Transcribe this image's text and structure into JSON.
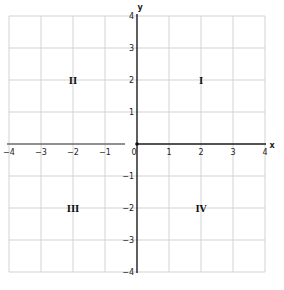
{
  "diagram": {
    "type": "coordinate-plane",
    "x_axis": {
      "label": "x",
      "min": -4,
      "max": 4,
      "step": 1
    },
    "y_axis": {
      "label": "y",
      "min": -4,
      "max": 4,
      "step": 1
    },
    "x_ticks": [
      {
        "value": -4,
        "label": "−4"
      },
      {
        "value": -3,
        "label": "−3"
      },
      {
        "value": -2,
        "label": "−2"
      },
      {
        "value": -1,
        "label": "−1"
      },
      {
        "value": 0,
        "label": "0"
      },
      {
        "value": 1,
        "label": "1"
      },
      {
        "value": 2,
        "label": "2"
      },
      {
        "value": 3,
        "label": "3"
      },
      {
        "value": 4,
        "label": "4"
      }
    ],
    "y_ticks": [
      {
        "value": 4,
        "label": "4"
      },
      {
        "value": 3,
        "label": "3"
      },
      {
        "value": 2,
        "label": "2"
      },
      {
        "value": 1,
        "label": "1"
      },
      {
        "value": -1,
        "label": "−1"
      },
      {
        "value": -2,
        "label": "−2"
      },
      {
        "value": -3,
        "label": "−3"
      },
      {
        "value": -4,
        "label": "−4"
      }
    ],
    "quadrants": [
      {
        "label": "I",
        "x": 2,
        "y": 2
      },
      {
        "label": "II",
        "x": -2,
        "y": 2
      },
      {
        "label": "III",
        "x": -2,
        "y": -2
      },
      {
        "label": "IV",
        "x": 2,
        "y": -2
      }
    ],
    "grid": true,
    "origin_marker": true
  }
}
